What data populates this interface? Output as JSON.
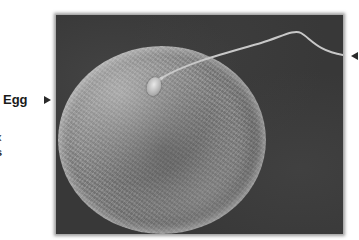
{
  "figure": {
    "labels": {
      "egg": "Egg",
      "partial_line_1": "x",
      "partial_line_2": "s"
    },
    "pointers": [
      {
        "name": "egg-pointer",
        "direction": "right"
      },
      {
        "name": "sperm-pointer",
        "direction": "left"
      }
    ],
    "colors": {
      "background": "#ffffff",
      "photo_background": "#383838",
      "egg_surface": "#8a8a8a",
      "label_text": "#1a1a1a"
    }
  }
}
